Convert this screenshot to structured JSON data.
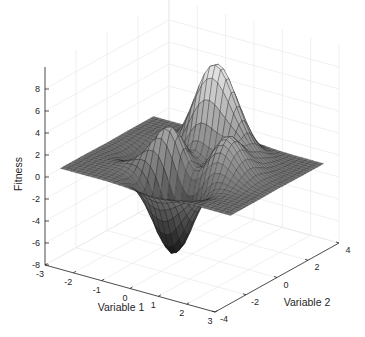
{
  "chart_data": {
    "type": "surface",
    "function": "peaks",
    "title": "",
    "xlabel": "Variable 1",
    "ylabel": "Variable 2",
    "zlabel": "Fitness",
    "xlim": [
      -3,
      3
    ],
    "ylim": [
      -4,
      4
    ],
    "zlim": [
      -8,
      10
    ],
    "xticks": [
      -3,
      -2,
      -1,
      0,
      1,
      2,
      3
    ],
    "yticks": [
      -4,
      -2,
      0,
      2,
      4
    ],
    "zticks": [
      -8,
      -6,
      -4,
      -2,
      0,
      2,
      4,
      6,
      8
    ],
    "xtick_labels": [
      "-3",
      "-2",
      "-1",
      "0",
      "1",
      "2",
      "3"
    ],
    "ytick_labels": [
      "-4",
      "-2",
      "0",
      "2",
      "4"
    ],
    "ztick_labels": [
      "-8",
      "-6",
      "-4",
      "-2",
      "0",
      "2",
      "4",
      "6",
      "8"
    ],
    "grid": true,
    "colormap": "gray",
    "mesh_resolution": 33,
    "z_max_approx": 8.1,
    "z_min_approx": -6.5,
    "legend": null
  },
  "colors": {
    "background": "#ffffff",
    "axis_line": "#262626",
    "grid_line": "#e6e6e6",
    "edge_color": "#1a1a1a"
  }
}
